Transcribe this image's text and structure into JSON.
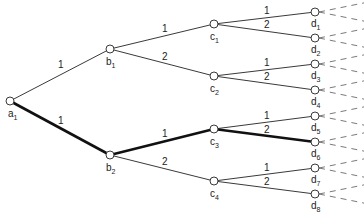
{
  "diagram": {
    "type": "tree",
    "highlight_color": "#111111",
    "line_color": "#3a3a3a",
    "nodes": [
      {
        "id": "a1",
        "base": "a",
        "sub": "1",
        "x": 10,
        "y": 101,
        "lx": 8,
        "ly": 117
      },
      {
        "id": "b1",
        "base": "b",
        "sub": "1",
        "x": 110,
        "y": 49,
        "lx": 106,
        "ly": 65
      },
      {
        "id": "b2",
        "base": "b",
        "sub": "2",
        "x": 110,
        "y": 155,
        "lx": 106,
        "ly": 171
      },
      {
        "id": "c1",
        "base": "c",
        "sub": "1",
        "x": 214,
        "y": 24,
        "lx": 210,
        "ly": 40
      },
      {
        "id": "c2",
        "base": "c",
        "sub": "2",
        "x": 214,
        "y": 76,
        "lx": 210,
        "ly": 92
      },
      {
        "id": "c3",
        "base": "c",
        "sub": "3",
        "x": 214,
        "y": 129,
        "lx": 210,
        "ly": 145
      },
      {
        "id": "c4",
        "base": "c",
        "sub": "4",
        "x": 214,
        "y": 181,
        "lx": 210,
        "ly": 197
      },
      {
        "id": "d1",
        "base": "d",
        "sub": "1",
        "x": 315,
        "y": 12,
        "lx": 311,
        "ly": 27
      },
      {
        "id": "d2",
        "base": "d",
        "sub": "2",
        "x": 315,
        "y": 38,
        "lx": 311,
        "ly": 53
      },
      {
        "id": "d3",
        "base": "d",
        "sub": "3",
        "x": 315,
        "y": 64,
        "lx": 311,
        "ly": 79
      },
      {
        "id": "d4",
        "base": "d",
        "sub": "4",
        "x": 315,
        "y": 90,
        "lx": 311,
        "ly": 105
      },
      {
        "id": "d5",
        "base": "d",
        "sub": "5",
        "x": 315,
        "y": 116,
        "lx": 311,
        "ly": 131
      },
      {
        "id": "d6",
        "base": "d",
        "sub": "6",
        "x": 315,
        "y": 142,
        "lx": 311,
        "ly": 157
      },
      {
        "id": "d7",
        "base": "d",
        "sub": "7",
        "x": 315,
        "y": 168,
        "lx": 311,
        "ly": 183
      },
      {
        "id": "d8",
        "base": "d",
        "sub": "8",
        "x": 315,
        "y": 194,
        "lx": 311,
        "ly": 209
      }
    ],
    "edges": [
      {
        "from": "a1",
        "to": "b1",
        "label": "1",
        "bold": false,
        "lx": 58,
        "ly": 68
      },
      {
        "from": "a1",
        "to": "b2",
        "label": "1",
        "bold": true,
        "lx": 58,
        "ly": 124
      },
      {
        "from": "b1",
        "to": "c1",
        "label": "1",
        "bold": false,
        "lx": 162,
        "ly": 32
      },
      {
        "from": "b1",
        "to": "c2",
        "label": "2",
        "bold": false,
        "lx": 162,
        "ly": 60
      },
      {
        "from": "b2",
        "to": "c3",
        "label": "1",
        "bold": true,
        "lx": 162,
        "ly": 137
      },
      {
        "from": "b2",
        "to": "c4",
        "label": "2",
        "bold": false,
        "lx": 162,
        "ly": 165
      },
      {
        "from": "c1",
        "to": "d1",
        "label": "1",
        "bold": false,
        "lx": 264,
        "ly": 14
      },
      {
        "from": "c1",
        "to": "d2",
        "label": "2",
        "bold": false,
        "lx": 264,
        "ly": 28
      },
      {
        "from": "c2",
        "to": "d3",
        "label": "1",
        "bold": false,
        "lx": 264,
        "ly": 66
      },
      {
        "from": "c2",
        "to": "d4",
        "label": "2",
        "bold": false,
        "lx": 264,
        "ly": 80
      },
      {
        "from": "c3",
        "to": "d5",
        "label": "1",
        "bold": false,
        "lx": 264,
        "ly": 119
      },
      {
        "from": "c3",
        "to": "d6",
        "label": "2",
        "bold": true,
        "lx": 264,
        "ly": 133
      },
      {
        "from": "c4",
        "to": "d7",
        "label": "1",
        "bold": false,
        "lx": 264,
        "ly": 171
      },
      {
        "from": "c4",
        "to": "d8",
        "label": "2",
        "bold": false,
        "lx": 264,
        "ly": 185
      }
    ],
    "dashed_continuation": {
      "dx_end": 364,
      "dy": 7
    }
  }
}
